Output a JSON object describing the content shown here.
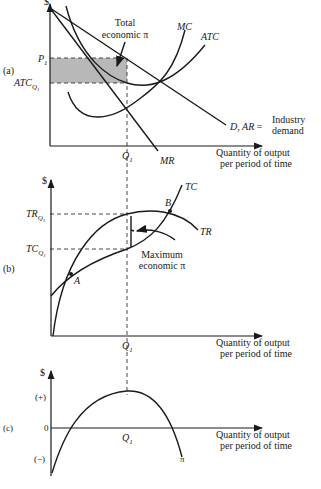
{
  "panels": {
    "a": {
      "label": "(a)",
      "y_axis_label": "$",
      "p1": "P",
      "p1_sub": "1",
      "atc": "ATC",
      "atc_sub": "Q",
      "atc_sub2": "1",
      "q1": "Q",
      "q1_sub": "1",
      "mc": "MC",
      "atc_curve": "ATC",
      "mr": "MR",
      "demand": "D, AR",
      "equals": "=",
      "industry_line1": "Industry",
      "industry_line2": "demand",
      "total_line1": "Total",
      "total_line2": "economic π",
      "x_line1": "Quantity of output",
      "x_line2": "per period of time",
      "shade_color": "#b8b8b8"
    },
    "b": {
      "label": "(b)",
      "y_axis_label": "$",
      "tr": "TR",
      "tc": "TC",
      "q_sub": "Q",
      "one_sub": "1",
      "q1": "Q",
      "q1_sub": "1",
      "point_a": "A",
      "point_b": "B",
      "tc_curve": "TC",
      "tr_curve": "TR",
      "max_line1": "Maximum",
      "max_line2": "economic π",
      "x_line1": "Quantity of output",
      "x_line2": "per period of time"
    },
    "c": {
      "label": "(c)",
      "y_axis_label": "$",
      "plus": "(+)",
      "zero": "0",
      "minus": "(−)",
      "q1": "Q",
      "q1_sub": "1",
      "pi_curve": "π",
      "x_line1": "Quantity of output",
      "x_line2": "per period of time"
    }
  }
}
